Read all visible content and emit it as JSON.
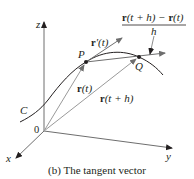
{
  "diagram": {
    "caption": "(b) The tangent vector",
    "axes": {
      "x_label": "x",
      "y_label": "y",
      "z_label": "z",
      "origin_label": "0"
    },
    "curve_label": "C",
    "points": {
      "P": "P",
      "Q": "Q"
    },
    "vectors": {
      "tangent": {
        "bold": "r",
        "rest": "′(t)"
      },
      "position_t": {
        "bold": "r",
        "rest": "(t)"
      },
      "position_th": {
        "bold": "r",
        "rest": "(t + h)"
      }
    },
    "difference_quotient": {
      "numerator_bold_1": "r",
      "numerator_rest_1": "(t + h) − ",
      "numerator_bold_2": "r",
      "numerator_rest_2": "(t)",
      "denominator": "h"
    },
    "colors": {
      "ink": "#231f20",
      "gray_line": "#8c8c8c",
      "background": "#ffffff"
    }
  }
}
